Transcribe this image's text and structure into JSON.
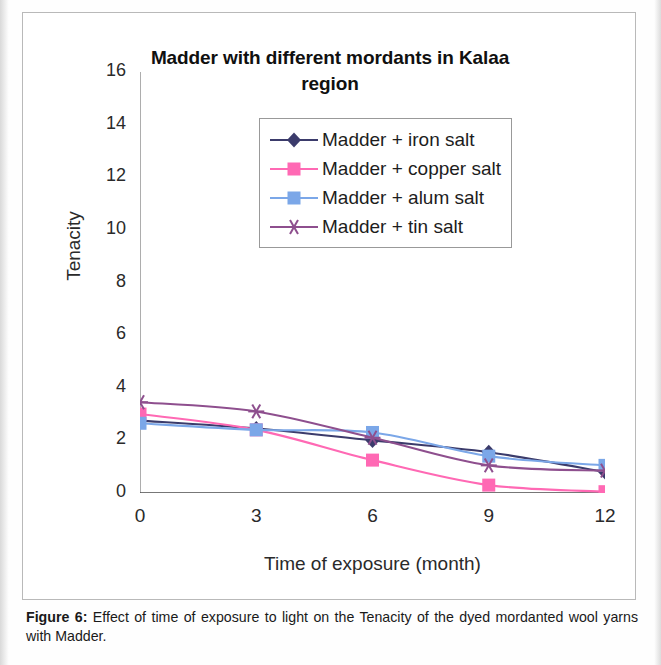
{
  "figure": {
    "caption_label": "Figure 6:",
    "caption_text": " Effect of time of exposure to light on the Tenacity of the dyed mordanted wool yarns with Madder."
  },
  "chart_data": {
    "type": "line",
    "title": "Madder with different mordants in Kalaa region",
    "xlabel": "Time of exposure (month)",
    "ylabel": "Tenacity",
    "x": [
      0,
      3,
      6,
      9,
      12
    ],
    "xtick_labels": [
      "0",
      "3",
      "6",
      "9",
      "12"
    ],
    "ytick_labels": [
      "0",
      "2",
      "4",
      "6",
      "8",
      "10",
      "12",
      "14",
      "16"
    ],
    "xlim": [
      0,
      12
    ],
    "ylim": [
      0,
      16
    ],
    "grid": false,
    "legend_position": "inside-top-center",
    "series": [
      {
        "name": "Madder + iron salt",
        "color": "#3b3b6b",
        "marker": "diamond",
        "values": [
          2.75,
          2.45,
          2.0,
          1.55,
          0.8
        ]
      },
      {
        "name": "Madder + copper salt",
        "color": "#ff69b4",
        "marker": "square",
        "values": [
          3.0,
          2.4,
          1.25,
          0.3,
          0.05
        ]
      },
      {
        "name": "Madder + alum salt",
        "color": "#7ba7e8",
        "marker": "square",
        "values": [
          2.65,
          2.4,
          2.3,
          1.4,
          1.05
        ]
      },
      {
        "name": "Madder + tin salt",
        "color": "#8e4f8e",
        "marker": "star",
        "values": [
          3.45,
          3.1,
          2.1,
          1.05,
          0.85
        ]
      }
    ]
  }
}
